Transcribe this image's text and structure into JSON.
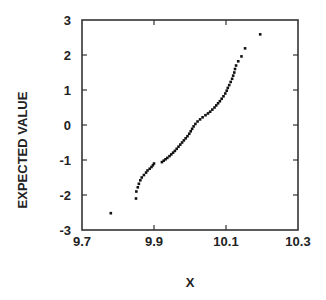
{
  "chart_data": {
    "type": "scatter",
    "title": "",
    "xlabel": "X",
    "ylabel": "EXPECTED VALUE",
    "xlim": [
      9.7,
      10.3
    ],
    "ylim": [
      -3,
      3
    ],
    "xticks": [
      "9.7",
      "9.9",
      "10.1",
      "10.3"
    ],
    "yticks": [
      "3",
      "2",
      "1",
      "0",
      "-1",
      "-2",
      "-3"
    ],
    "grid": false,
    "legend": null,
    "marker_color": "#111111",
    "series": [
      {
        "name": "normal probability plot",
        "points": [
          [
            9.78,
            -2.52
          ],
          [
            9.85,
            -2.1
          ],
          [
            9.851,
            -1.9
          ],
          [
            9.855,
            -1.78
          ],
          [
            9.858,
            -1.68
          ],
          [
            9.862,
            -1.58
          ],
          [
            9.866,
            -1.5
          ],
          [
            9.872,
            -1.43
          ],
          [
            9.878,
            -1.36
          ],
          [
            9.882,
            -1.3
          ],
          [
            9.888,
            -1.25
          ],
          [
            9.893,
            -1.2
          ],
          [
            9.897,
            -1.15
          ],
          [
            9.9,
            -1.1
          ],
          [
            9.922,
            -1.06
          ],
          [
            9.927,
            -1.02
          ],
          [
            9.932,
            -0.98
          ],
          [
            9.937,
            -0.94
          ],
          [
            9.943,
            -0.89
          ],
          [
            9.948,
            -0.84
          ],
          [
            9.953,
            -0.79
          ],
          [
            9.958,
            -0.74
          ],
          [
            9.963,
            -0.68
          ],
          [
            9.968,
            -0.62
          ],
          [
            9.973,
            -0.56
          ],
          [
            9.978,
            -0.5
          ],
          [
            9.983,
            -0.44
          ],
          [
            9.988,
            -0.38
          ],
          [
            9.993,
            -0.32
          ],
          [
            9.998,
            -0.25
          ],
          [
            10.002,
            -0.18
          ],
          [
            10.006,
            -0.11
          ],
          [
            10.01,
            -0.04
          ],
          [
            10.015,
            0.03
          ],
          [
            10.021,
            0.1
          ],
          [
            10.028,
            0.16
          ],
          [
            10.035,
            0.22
          ],
          [
            10.043,
            0.28
          ],
          [
            10.05,
            0.33
          ],
          [
            10.056,
            0.38
          ],
          [
            10.062,
            0.44
          ],
          [
            10.068,
            0.5
          ],
          [
            10.073,
            0.56
          ],
          [
            10.078,
            0.62
          ],
          [
            10.083,
            0.68
          ],
          [
            10.088,
            0.75
          ],
          [
            10.093,
            0.82
          ],
          [
            10.098,
            0.9
          ],
          [
            10.102,
            0.98
          ],
          [
            10.105,
            1.06
          ],
          [
            10.109,
            1.14
          ],
          [
            10.113,
            1.23
          ],
          [
            10.117,
            1.32
          ],
          [
            10.12,
            1.41
          ],
          [
            10.123,
            1.5
          ],
          [
            10.125,
            1.6
          ],
          [
            10.128,
            1.7
          ],
          [
            10.134,
            1.82
          ],
          [
            10.143,
            1.96
          ],
          [
            10.153,
            2.19
          ],
          [
            10.195,
            2.59
          ]
        ]
      }
    ]
  }
}
